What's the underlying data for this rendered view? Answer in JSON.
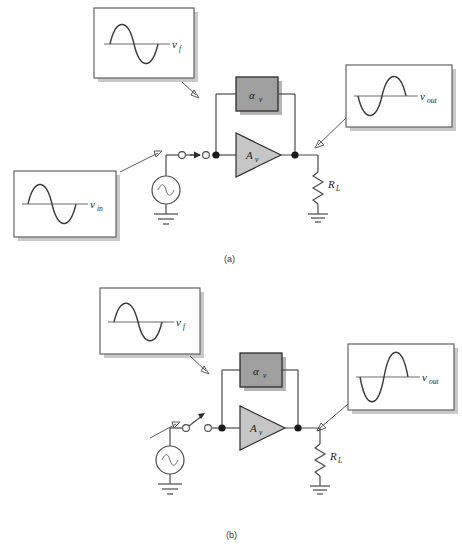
{
  "figure": {
    "panels": [
      {
        "id": "a",
        "caption": "(a)",
        "blocks": {
          "attenuator_label": "α",
          "attenuator_sub": "v",
          "amplifier_label": "A",
          "amplifier_sub": "v",
          "load_label": "R",
          "load_sub": "L"
        },
        "waveforms": [
          {
            "name": "feedback",
            "label": "v",
            "sub": "f",
            "phase": "positive-first",
            "amplitude": "normal"
          },
          {
            "name": "output",
            "label": "v",
            "sub": "out",
            "phase": "negative-first",
            "amplitude": "normal"
          },
          {
            "name": "input",
            "label": "v",
            "sub": "in",
            "phase": "positive-first",
            "amplitude": "normal"
          }
        ],
        "switch_state": "closed"
      },
      {
        "id": "b",
        "caption": "(b)",
        "blocks": {
          "attenuator_label": "α",
          "attenuator_sub": "v",
          "amplifier_label": "A",
          "amplifier_sub": "v",
          "load_label": "R",
          "load_sub": "L"
        },
        "waveforms": [
          {
            "name": "feedback",
            "label": "v",
            "sub": "f",
            "phase": "positive-first",
            "amplitude": "normal"
          },
          {
            "name": "output",
            "label": "v",
            "sub": "out",
            "phase": "negative-first",
            "amplitude": "large"
          }
        ],
        "switch_state": "open"
      }
    ]
  },
  "colors": {
    "wire": "#4a4a4a",
    "block_fill": "#9f9f9f",
    "amp_fill": "#c6c6c6",
    "box_shadow": "#c9c9c9",
    "wave_stroke": "#3b3b3b",
    "background": "#ffffff"
  }
}
